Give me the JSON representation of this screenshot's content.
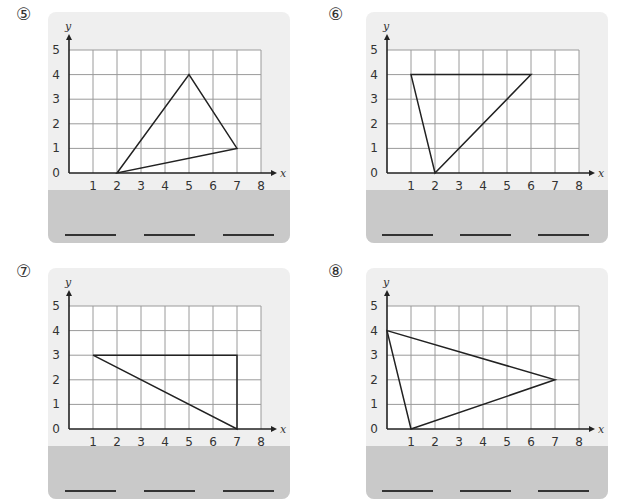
{
  "problems": [
    {
      "label": "⑤",
      "chart_data": {
        "type": "scatter",
        "title": "",
        "xlabel": "x",
        "ylabel": "y",
        "xlim": [
          0,
          8
        ],
        "ylim": [
          0,
          5
        ],
        "x_ticks": [
          "1",
          "2",
          "3",
          "4",
          "5",
          "6",
          "7",
          "8"
        ],
        "y_ticks": [
          "0",
          "1",
          "2",
          "3",
          "4",
          "5"
        ],
        "grid": true,
        "shape": "triangle",
        "vertices": [
          [
            2,
            0
          ],
          [
            5,
            4
          ],
          [
            7,
            1
          ]
        ]
      },
      "answer_blanks": 3
    },
    {
      "label": "⑥",
      "chart_data": {
        "type": "scatter",
        "title": "",
        "xlabel": "x",
        "ylabel": "y",
        "xlim": [
          0,
          8
        ],
        "ylim": [
          0,
          5
        ],
        "x_ticks": [
          "1",
          "2",
          "3",
          "4",
          "5",
          "6",
          "7",
          "8"
        ],
        "y_ticks": [
          "0",
          "1",
          "2",
          "3",
          "4",
          "5"
        ],
        "grid": true,
        "shape": "triangle",
        "vertices": [
          [
            1,
            4
          ],
          [
            6,
            4
          ],
          [
            2,
            0
          ]
        ]
      },
      "answer_blanks": 3
    },
    {
      "label": "⑦",
      "chart_data": {
        "type": "scatter",
        "title": "",
        "xlabel": "x",
        "ylabel": "y",
        "xlim": [
          0,
          8
        ],
        "ylim": [
          0,
          5
        ],
        "x_ticks": [
          "1",
          "2",
          "3",
          "4",
          "5",
          "6",
          "7",
          "8"
        ],
        "y_ticks": [
          "0",
          "1",
          "2",
          "3",
          "4",
          "5"
        ],
        "grid": true,
        "shape": "triangle",
        "vertices": [
          [
            1,
            3
          ],
          [
            7,
            3
          ],
          [
            7,
            0
          ]
        ]
      },
      "answer_blanks": 3
    },
    {
      "label": "⑧",
      "chart_data": {
        "type": "scatter",
        "title": "",
        "xlabel": "x",
        "ylabel": "y",
        "xlim": [
          0,
          8
        ],
        "ylim": [
          0,
          5
        ],
        "x_ticks": [
          "1",
          "2",
          "3",
          "4",
          "5",
          "6",
          "7",
          "8"
        ],
        "y_ticks": [
          "0",
          "1",
          "2",
          "3",
          "4",
          "5"
        ],
        "grid": true,
        "shape": "triangle",
        "vertices": [
          [
            0,
            4
          ],
          [
            7,
            2
          ],
          [
            1,
            0
          ]
        ]
      },
      "answer_blanks": 3
    }
  ],
  "colors": {
    "card_bg": "#efefef",
    "answer_band": "#c9c9c9",
    "grid_line": "#9a9a9a",
    "axis": "#222222",
    "shape_stroke": "#222222"
  }
}
